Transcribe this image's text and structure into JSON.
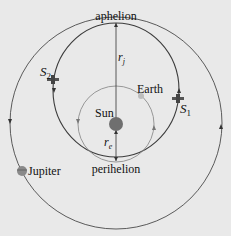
{
  "diagram": {
    "labels": {
      "aphelion": "aphelion",
      "perihelion": "perihelion",
      "sun": "Sun",
      "earth": "Earth",
      "jupiter": "Jupiter",
      "r_j": "r",
      "r_j_sub": "j",
      "r_e": "r",
      "r_e_sub": "e",
      "s1": "S",
      "s1_sub": "1",
      "s2": "S",
      "s2_sub": "2"
    },
    "bodies": [
      {
        "name": "Sun",
        "color": "#6f6f6f"
      },
      {
        "name": "Earth",
        "color": "#bdbdbd"
      },
      {
        "name": "Jupiter",
        "color": "#8a8a8a"
      }
    ],
    "orbits": [
      {
        "name": "Jupiter orbit",
        "direction": "counterclockwise"
      },
      {
        "name": "Earth orbit",
        "direction": "counterclockwise"
      },
      {
        "name": "Transfer ellipse",
        "direction": "S1 outbound to aphelion, S2 inbound to perihelion"
      }
    ],
    "colors": {
      "background": "#e9e9e9",
      "line_dark": "#444444",
      "line_light": "#8d8d8d"
    }
  }
}
